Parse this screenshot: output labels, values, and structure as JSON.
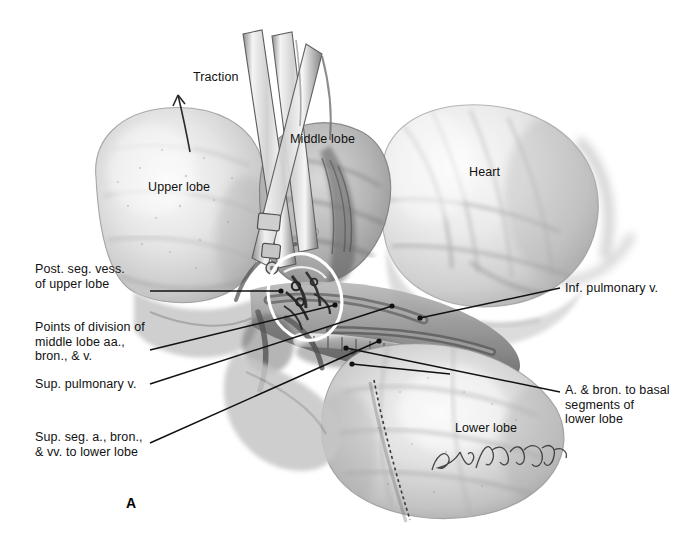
{
  "figure": {
    "panel_label": "A",
    "background_color": "#ffffff",
    "ink_color": "#111111",
    "highlight_color": "#ffffff",
    "signature": "Lou Hollabaugh"
  },
  "labels": [
    {
      "id": "traction",
      "text": "Traction",
      "x": 193,
      "y": 77,
      "align": "left"
    },
    {
      "id": "upper-lobe",
      "text": "Upper lobe",
      "x": 148,
      "y": 187,
      "align": "left"
    },
    {
      "id": "middle-lobe",
      "text": "Middle lobe",
      "x": 290,
      "y": 139,
      "align": "left"
    },
    {
      "id": "heart",
      "text": "Heart",
      "x": 469,
      "y": 172,
      "align": "left"
    },
    {
      "id": "lower-lobe",
      "text": "Lower lobe",
      "x": 455,
      "y": 428,
      "align": "left"
    },
    {
      "id": "post-seg-vess",
      "text": "Post. seg. vess.\nof upper lobe",
      "x": 35,
      "y": 262,
      "align": "left"
    },
    {
      "id": "points-division",
      "text": "Points of division of\nmiddle lobe aa.,\nbron., & v.",
      "x": 35,
      "y": 320,
      "align": "left"
    },
    {
      "id": "sup-pulm-v",
      "text": "Sup. pulmonary v.",
      "x": 35,
      "y": 382,
      "align": "left"
    },
    {
      "id": "sup-seg-lower",
      "text": "Sup. seg. a., bron.,\n& vv. to lower lobe",
      "x": 35,
      "y": 430,
      "align": "left"
    },
    {
      "id": "inf-pulm-v",
      "text": "Inf. pulmonary v.",
      "x": 565,
      "y": 284,
      "align": "left"
    },
    {
      "id": "a-bron-basal",
      "text": "A. & bron. to basal\nsegments of\nlower lobe",
      "x": 565,
      "y": 387,
      "align": "left"
    }
  ],
  "leaders": [
    {
      "id": "leader-post-seg-vess",
      "from": [
        150,
        291
      ],
      "to": [
        281,
        291
      ],
      "dot": true
    },
    {
      "id": "leader-points-division",
      "from": [
        150,
        350
      ],
      "to": [
        335,
        305
      ],
      "dot": true
    },
    {
      "id": "leader-sup-pulm-v",
      "from": [
        150,
        384
      ],
      "to": [
        392,
        306
      ],
      "dot": true
    },
    {
      "id": "leader-sup-seg-lower",
      "from": [
        150,
        443
      ],
      "to": [
        379,
        341
      ],
      "dot": true
    },
    {
      "id": "leader-inf-pulm-v",
      "from": [
        560,
        288
      ],
      "to": [
        420,
        318
      ],
      "dot": true
    },
    {
      "id": "leader-a-bron-basal",
      "from": [
        560,
        392
      ],
      "to": [
        346,
        348
      ],
      "dot": true
    },
    {
      "id": "leader-a-bron-basal-2",
      "from": [
        560,
        392
      ],
      "to": [
        352,
        364
      ],
      "dot": true
    }
  ],
  "annotations": {
    "highlight_ellipse": {
      "cx": 305,
      "cy": 297,
      "rx": 36,
      "ry": 44,
      "rotation": -18
    },
    "traction_arrow": {
      "from": [
        190,
        152
      ],
      "to": [
        178,
        95
      ]
    },
    "suture_dashes": {
      "from": [
        374,
        380
      ],
      "to": [
        410,
        520
      ]
    }
  },
  "anatomy": {
    "regions": [
      {
        "name": "upper-lobe",
        "description": "Upper lobe of right lung, left of hilum"
      },
      {
        "name": "middle-lobe",
        "description": "Middle lobe retracted by clamp"
      },
      {
        "name": "lower-lobe",
        "description": "Lower lobe, lower right of field"
      },
      {
        "name": "heart",
        "description": "Heart in pericardium, upper right"
      },
      {
        "name": "hilum",
        "description": "Hilar vessels and bronchus, center"
      }
    ],
    "instruments": [
      {
        "name": "clamp-forceps",
        "description": "Long curved clamp retracting middle lobe"
      },
      {
        "name": "clamp-forceps-2",
        "description": "Second clamp alongside first"
      }
    ]
  }
}
